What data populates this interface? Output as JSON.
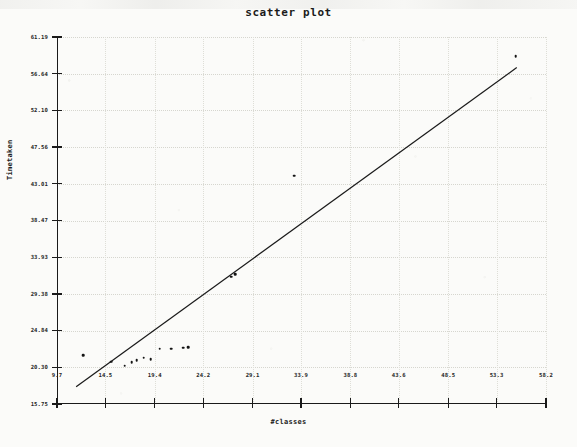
{
  "chart_data": {
    "type": "scatter",
    "title": "scatter plot",
    "xlabel": "#classes",
    "ylabel": "Timetaken",
    "xlim": [
      9.7,
      58.2
    ],
    "ylim": [
      15.75,
      61.19
    ],
    "grid": true,
    "legend": "none",
    "xticks": [
      "9.7",
      "14.5",
      "19.4",
      "24.2",
      "29.1",
      "33.9",
      "38.8",
      "43.6",
      "48.5",
      "53.3",
      "58.2"
    ],
    "xtick_values": [
      9.7,
      14.5,
      19.4,
      24.2,
      29.1,
      33.9,
      38.8,
      43.6,
      48.5,
      53.3,
      58.2
    ],
    "yticks": [
      "15.75",
      "20.30",
      "24.84",
      "29.38",
      "33.93",
      "38.47",
      "43.01",
      "47.56",
      "52.10",
      "56.64",
      "61.19"
    ],
    "ytick_values": [
      15.75,
      20.3,
      24.84,
      29.38,
      33.93,
      38.47,
      43.01,
      47.56,
      52.1,
      56.64,
      61.19
    ],
    "points": [
      {
        "x": 12.3,
        "y": 21.8
      },
      {
        "x": 15.1,
        "y": 21.0
      },
      {
        "x": 16.4,
        "y": 20.5
      },
      {
        "x": 17.1,
        "y": 20.9
      },
      {
        "x": 17.6,
        "y": 21.2
      },
      {
        "x": 18.3,
        "y": 21.5
      },
      {
        "x": 19.0,
        "y": 21.3
      },
      {
        "x": 19.9,
        "y": 22.6
      },
      {
        "x": 21.0,
        "y": 22.6
      },
      {
        "x": 22.2,
        "y": 22.7
      },
      {
        "x": 22.7,
        "y": 22.8
      },
      {
        "x": 27.0,
        "y": 31.5
      },
      {
        "x": 27.4,
        "y": 31.8
      },
      {
        "x": 33.2,
        "y": 44.0
      },
      {
        "x": 55.2,
        "y": 58.8
      }
    ],
    "trendline": {
      "style": "solid",
      "color": "#1a1a1a",
      "x_start": 11.6,
      "y_start": 17.9,
      "x_end": 55.3,
      "y_end": 57.4
    }
  }
}
